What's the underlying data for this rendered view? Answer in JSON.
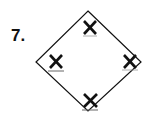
{
  "problem": {
    "number_label": "7."
  },
  "diagram": {
    "shape": "diamond",
    "vertices": {
      "top": [
        88,
        11
      ],
      "right": [
        141,
        62
      ],
      "bottom": [
        88,
        111
      ],
      "left": [
        36,
        62
      ]
    },
    "marks": [
      {
        "position": "top",
        "glyph": "X"
      },
      {
        "position": "left",
        "glyph": "X"
      },
      {
        "position": "right",
        "glyph": "X"
      },
      {
        "position": "bottom",
        "glyph": "X"
      }
    ],
    "stroke_color": "#111111",
    "background": "#ffffff"
  }
}
